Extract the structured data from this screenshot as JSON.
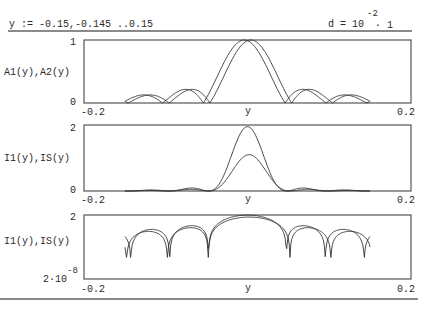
{
  "header": {
    "range_definition": "y := -0.15,-0.145 ..0.15",
    "d_definition": {
      "lhs": "d = 10",
      "exponent": "-2",
      "tail": "· 1"
    }
  },
  "plots": [
    {
      "ylabel": "A1(y),A2(y)",
      "ytick_top": "1",
      "ytick_bottom": "0",
      "xtick_left": "-0.2",
      "xtick_right": "0.2",
      "xlabel": "y"
    },
    {
      "ylabel": "I1(y),IS(y)",
      "ytick_top": "2",
      "ytick_bottom": "0",
      "xtick_left": "-0.2",
      "xtick_right": "0.2",
      "xlabel": "y"
    },
    {
      "ylabel": "I1(y),IS(y)",
      "ytick_top": "2",
      "ytick_bottom_mantissa": "2·10",
      "ytick_bottom_exponent": "-8",
      "xtick_left": "-0.2",
      "xtick_right": "0.2",
      "xlabel": "y"
    }
  ],
  "chart_data": [
    {
      "type": "line",
      "title": "",
      "xlabel": "y",
      "ylabel": "A1(y),A2(y)",
      "xlim": [
        -0.2,
        0.2
      ],
      "ylim": [
        0,
        1
      ],
      "x": {
        "start": -0.15,
        "step": 0.005,
        "end": 0.15
      },
      "series": [
        {
          "name": "A1(y)",
          "description": "|sinc| amplitude, peak 1 near y=-0.004, zeros every 0.05"
        },
        {
          "name": "A2(y)",
          "description": "|sinc| amplitude, peak 1 near y=+0.004, zeros every 0.05"
        }
      ],
      "grid": false
    },
    {
      "type": "line",
      "title": "",
      "xlabel": "y",
      "ylabel": "I1(y),IS(y)",
      "xlim": [
        -0.2,
        0.2
      ],
      "ylim": [
        0,
        2
      ],
      "x": {
        "start": -0.15,
        "step": 0.005,
        "end": 0.15
      },
      "series": [
        {
          "name": "I1(y)",
          "peak": 1.1
        },
        {
          "name": "IS(y)",
          "peak": 1.95
        }
      ],
      "grid": false
    },
    {
      "type": "line",
      "title": "",
      "xlabel": "y",
      "ylabel": "I1(y),IS(y)",
      "yscale": "log",
      "xlim": [
        -0.2,
        0.2
      ],
      "ylim": [
        2e-08,
        2
      ],
      "x": {
        "start": -0.15,
        "step": 0.005,
        "end": 0.15
      },
      "series": [
        {
          "name": "I1(y)",
          "description": "log intensity, dips near y=±0.05, ±0.1"
        },
        {
          "name": "IS(y)",
          "description": "log intensity, dips near y=±0.05, ±0.1"
        }
      ],
      "grid": false
    }
  ]
}
